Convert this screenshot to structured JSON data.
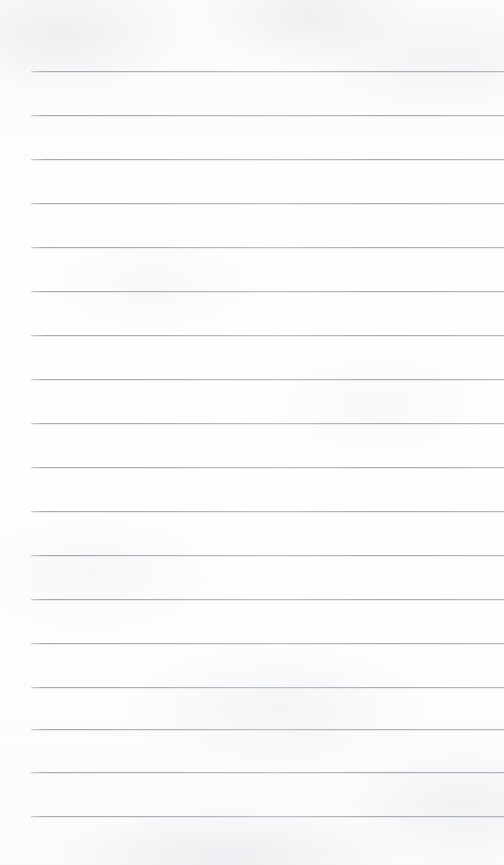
{
  "document": {
    "type": "lined-notebook-paper",
    "title": "Blank lined paper sheet",
    "page_width": 504,
    "page_height": 865,
    "background_color": "#fdfdfd",
    "has_text_content": false,
    "written_content": "",
    "paper": {
      "texture": "subtle mottled scan grain",
      "edge_tone": "#fbfbfc"
    },
    "ruling": {
      "line_color": "#a9adb2",
      "line_thickness_px": 1,
      "line_spacing_px": 46.5,
      "first_line_y": 71,
      "last_line_y": 816,
      "line_left_x": 31,
      "line_right_x": 504,
      "line_count": 18,
      "has_vertical_margin_rule": false,
      "top_margin_px": 71,
      "bottom_margin_px": 49,
      "lines": [
        {
          "index": 1,
          "y": 71
        },
        {
          "index": 2,
          "y": 115
        },
        {
          "index": 3,
          "y": 159
        },
        {
          "index": 4,
          "y": 203
        },
        {
          "index": 5,
          "y": 247
        },
        {
          "index": 6,
          "y": 291
        },
        {
          "index": 7,
          "y": 335
        },
        {
          "index": 8,
          "y": 379
        },
        {
          "index": 9,
          "y": 423
        },
        {
          "index": 10,
          "y": 467
        },
        {
          "index": 11,
          "y": 511
        },
        {
          "index": 12,
          "y": 555
        },
        {
          "index": 13,
          "y": 599
        },
        {
          "index": 14,
          "y": 643
        },
        {
          "index": 15,
          "y": 687
        },
        {
          "index": 16,
          "y": 729
        },
        {
          "index": 17,
          "y": 772
        },
        {
          "index": 18,
          "y": 816
        }
      ]
    }
  }
}
